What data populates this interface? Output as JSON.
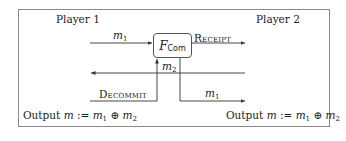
{
  "diagram": {
    "type": "protocol-flow",
    "players": {
      "left": "Player 1",
      "right": "Player 2"
    },
    "functionality": {
      "symbol": "F",
      "subscript": "Com"
    },
    "messages": {
      "m1_in": {
        "base": "m",
        "sub": "1"
      },
      "receipt": "Receipt",
      "m2": {
        "base": "m",
        "sub": "2"
      },
      "decommit": "Decommit",
      "m1_out": {
        "base": "m",
        "sub": "1"
      }
    },
    "outputs": {
      "left": {
        "prefix": "Output ",
        "var": "m",
        "assign": " := ",
        "a": "m",
        "a_sub": "1",
        "op": " ⊕ ",
        "b": "m",
        "b_sub": "2"
      },
      "right": {
        "prefix": "Output ",
        "var": "m",
        "assign": " := ",
        "a": "m",
        "a_sub": "1",
        "op": " ⊕ ",
        "b": "m",
        "b_sub": "2"
      }
    },
    "colors": {
      "frame": "#8a8a8a",
      "line": "#333333",
      "text": "#222222"
    }
  }
}
